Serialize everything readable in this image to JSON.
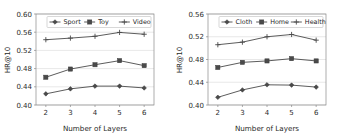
{
  "figure": {
    "background_color": "#ffffff",
    "line_color": "#4a4a4a",
    "grid_color": "#d9d9d9",
    "axis_color": "#8a8a8a"
  },
  "chart_data": [
    {
      "type": "line",
      "panel": "left",
      "title": "",
      "xlabel": "Number of Layers",
      "ylabel": "HR@10",
      "x": [
        2,
        3,
        4,
        5,
        6
      ],
      "categories": [
        "2",
        "3",
        "4",
        "5",
        "6"
      ],
      "xtick_labels": [
        "2",
        "3",
        "4",
        "5",
        "6"
      ],
      "ytick_labels": [
        "0.40",
        "0.44",
        "0.48",
        "0.52",
        "0.56",
        "0.60"
      ],
      "ytick_values": [
        0.4,
        0.44,
        0.48,
        0.52,
        0.56,
        0.6
      ],
      "xlim": [
        1.6,
        6.4
      ],
      "ylim": [
        0.4,
        0.6
      ],
      "grid": true,
      "legend_position": "upper center",
      "series": [
        {
          "name": "Sport",
          "marker": "diamond",
          "values": [
            0.4245,
            0.4355,
            0.4415,
            0.4415,
            0.4375
          ]
        },
        {
          "name": "Toy",
          "marker": "square",
          "values": [
            0.461,
            0.479,
            0.4885,
            0.4975,
            0.4865
          ]
        },
        {
          "name": "Video",
          "marker": "plus",
          "values": [
            0.5435,
            0.547,
            0.551,
            0.5595,
            0.5555
          ]
        }
      ]
    },
    {
      "type": "line",
      "panel": "right",
      "title": "",
      "xlabel": "Number of Layers",
      "ylabel": "HR@10",
      "x": [
        2,
        3,
        4,
        5,
        6
      ],
      "categories": [
        "2",
        "3",
        "4",
        "5",
        "6"
      ],
      "xtick_labels": [
        "2",
        "3",
        "4",
        "5",
        "6"
      ],
      "ytick_labels": [
        "0.40",
        "0.44",
        "0.48",
        "0.52",
        "0.56"
      ],
      "ytick_values": [
        0.4,
        0.44,
        0.48,
        0.52,
        0.56
      ],
      "xlim": [
        1.6,
        6.4
      ],
      "ylim": [
        0.4,
        0.56
      ],
      "grid": true,
      "legend_position": "upper center",
      "series": [
        {
          "name": "Cloth",
          "marker": "diamond",
          "values": [
            0.4135,
            0.4265,
            0.4355,
            0.435,
            0.4315
          ]
        },
        {
          "name": "Home",
          "marker": "square",
          "values": [
            0.466,
            0.475,
            0.4775,
            0.4815,
            0.4775
          ]
        },
        {
          "name": "Health",
          "marker": "plus",
          "values": [
            0.506,
            0.5105,
            0.52,
            0.524,
            0.514
          ]
        }
      ]
    }
  ]
}
